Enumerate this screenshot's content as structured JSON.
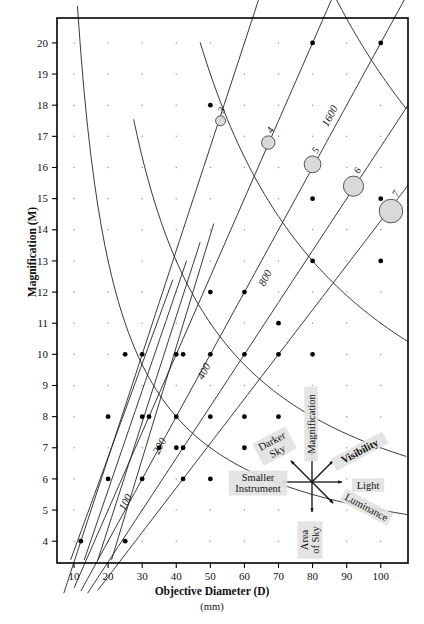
{
  "figure": {
    "x_axis": {
      "title": "Objective Diameter (D)",
      "unit": "(mm)",
      "ticks": [
        10,
        20,
        30,
        40,
        50,
        60,
        70,
        80,
        90,
        100
      ],
      "min": 5,
      "max": 108
    },
    "y_axis": {
      "title": "Magnification (M)",
      "ticks": [
        4,
        5,
        6,
        7,
        8,
        9,
        10,
        11,
        12,
        13,
        14,
        15,
        16,
        17,
        18,
        19,
        20
      ],
      "min": 3.3,
      "max": 20.8
    }
  },
  "chart_data": {
    "type": "scatter",
    "title": "",
    "xlabel": "Objective Diameter (D)",
    "ylabel": "Magnification (M)",
    "xlim": [
      5,
      108
    ],
    "ylim": [
      3.3,
      20.8
    ],
    "grid": "dot-matrix",
    "legend": "compass-rose-inset",
    "series": [
      {
        "name": "exit-pupil-curves",
        "kind": "line",
        "note": "Lines of constant exit pupil P = D / M, rising left-to-right",
        "labels": [
          "3",
          "4",
          "5",
          "6",
          "7"
        ],
        "values": [
          3,
          4,
          5,
          6,
          7
        ]
      },
      {
        "name": "light-grasp-curves",
        "kind": "line",
        "note": "Lines of constant relative light gathering, falling left-to-right",
        "labels": [
          "100",
          "200",
          "400",
          "800",
          "1600"
        ],
        "values": [
          100,
          200,
          400,
          800,
          1600
        ]
      },
      {
        "name": "exit-pupil-markers",
        "kind": "scatter-sized",
        "note": "Grey discs sized by exit pupil diameter in mm",
        "points": [
          {
            "label": "3",
            "x": 53,
            "y": 17.5,
            "size_mm": 3
          },
          {
            "label": "4",
            "x": 67,
            "y": 16.8,
            "size_mm": 4
          },
          {
            "label": "5",
            "x": 80,
            "y": 16.1,
            "size_mm": 5
          },
          {
            "label": "6",
            "x": 92,
            "y": 15.4,
            "size_mm": 6
          },
          {
            "label": "7",
            "x": 103,
            "y": 14.6,
            "size_mm": 7
          }
        ]
      },
      {
        "name": "instrument-points",
        "kind": "scatter",
        "note": "Filled black dots marking available telescope / eyepiece combinations",
        "points": [
          {
            "x": 12,
            "y": 4
          },
          {
            "x": 25,
            "y": 4
          },
          {
            "x": 20,
            "y": 6
          },
          {
            "x": 30,
            "y": 6
          },
          {
            "x": 42,
            "y": 6
          },
          {
            "x": 50,
            "y": 6
          },
          {
            "x": 35,
            "y": 7
          },
          {
            "x": 40,
            "y": 7
          },
          {
            "x": 42,
            "y": 7
          },
          {
            "x": 60,
            "y": 7
          },
          {
            "x": 20,
            "y": 8
          },
          {
            "x": 30,
            "y": 8
          },
          {
            "x": 32,
            "y": 8
          },
          {
            "x": 40,
            "y": 8
          },
          {
            "x": 50,
            "y": 8
          },
          {
            "x": 60,
            "y": 8
          },
          {
            "x": 70,
            "y": 8
          },
          {
            "x": 25,
            "y": 10
          },
          {
            "x": 30,
            "y": 10
          },
          {
            "x": 40,
            "y": 10
          },
          {
            "x": 42,
            "y": 10
          },
          {
            "x": 50,
            "y": 10
          },
          {
            "x": 60,
            "y": 10
          },
          {
            "x": 70,
            "y": 10
          },
          {
            "x": 80,
            "y": 10
          },
          {
            "x": 50,
            "y": 12
          },
          {
            "x": 60,
            "y": 12
          },
          {
            "x": 70,
            "y": 11
          },
          {
            "x": 80,
            "y": 13
          },
          {
            "x": 100,
            "y": 13
          },
          {
            "x": 80,
            "y": 15
          },
          {
            "x": 100,
            "y": 15
          },
          {
            "x": 50,
            "y": 18
          },
          {
            "x": 80,
            "y": 20
          },
          {
            "x": 100,
            "y": 20
          }
        ]
      }
    ],
    "curve_labels": {
      "exit_pupil": [
        "3",
        "4",
        "5",
        "6",
        "7"
      ],
      "light_grasp": [
        "100",
        "200",
        "400",
        "800",
        "1600"
      ]
    }
  },
  "inset_legend": {
    "name": "trade-off-compass",
    "arrows": [
      {
        "id": "up",
        "label": "Magnification",
        "bold": false,
        "angle": 0
      },
      {
        "id": "up-right",
        "label": "Visibility",
        "bold": true,
        "angle": 45
      },
      {
        "id": "right",
        "label": "Light",
        "bold": false,
        "angle": 90
      },
      {
        "id": "down-right",
        "label": "Luminance",
        "bold": false,
        "angle": 135
      },
      {
        "id": "down",
        "label": "Area of Sky",
        "bold": false,
        "angle": 180
      },
      {
        "id": "left",
        "label": "Smaller Instrument",
        "bold": false,
        "angle": 270
      },
      {
        "id": "up-left",
        "label": "Darker Sky",
        "bold": false,
        "angle": 315
      }
    ]
  },
  "colors": {
    "ink": "#111111",
    "frame": "#000000",
    "disc_fill": "#d9d9d9",
    "disc_stroke": "#444444",
    "label_bg": "#e2e2e2",
    "grid_dot": "#9a9a9a"
  }
}
